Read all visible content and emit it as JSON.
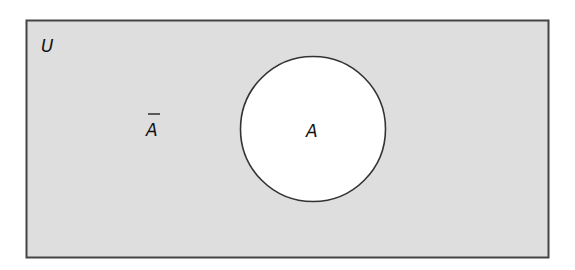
{
  "diagram": {
    "type": "venn",
    "universe": {
      "label": "U",
      "fill": "#dedede",
      "stroke": "#444444"
    },
    "set": {
      "label": "A",
      "fill": "#ffffff",
      "stroke": "#333333"
    },
    "complement": {
      "label": "A",
      "overbar": true,
      "description": "complement of A"
    }
  }
}
